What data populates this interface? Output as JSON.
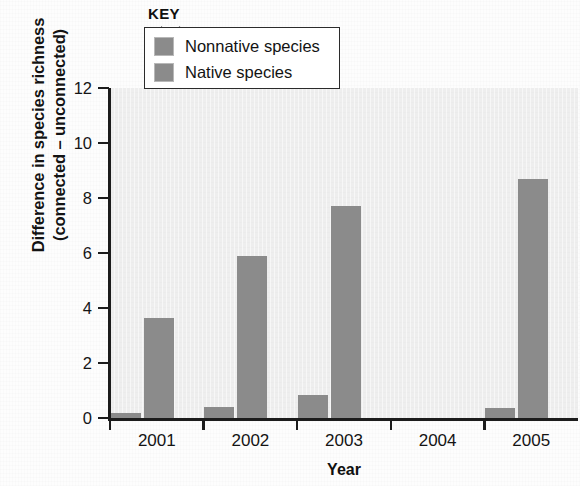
{
  "chart_data": {
    "type": "bar",
    "title": "",
    "xlabel": "Year",
    "ylabel_line1": "Difference in species richness",
    "ylabel_line2": "(connected – unconnected)",
    "categories": [
      "2001",
      "2002",
      "2003",
      "2004",
      "2005"
    ],
    "ylim": [
      0,
      12
    ],
    "yticks": [
      0,
      2,
      4,
      6,
      8,
      10,
      12
    ],
    "ytick_labels": [
      "0",
      "2",
      "4",
      "6",
      "8",
      "10",
      "12"
    ],
    "grid": false,
    "legend_position": "top-center",
    "series": [
      {
        "name": "Nonnative species",
        "color": "#8b8b8b",
        "values": [
          0.2,
          0.4,
          0.85,
          0,
          0.35
        ]
      },
      {
        "name": "Native species",
        "color": "#8b8b8b",
        "values": [
          3.65,
          5.9,
          7.7,
          0,
          8.7
        ]
      }
    ]
  },
  "legend": {
    "key_label": "KEY",
    "entries": [
      {
        "label": "Nonnative species",
        "color": "#8b8b8b"
      },
      {
        "label": "Native species",
        "color": "#8b8b8b"
      }
    ]
  },
  "colors": {
    "bar": "#8b8b8b",
    "plot_background": "#eeeeee",
    "axis": "#1c1c1c",
    "text": "#141414",
    "legend_background": "#ffffff",
    "legend_border": "#2b2b2b"
  }
}
